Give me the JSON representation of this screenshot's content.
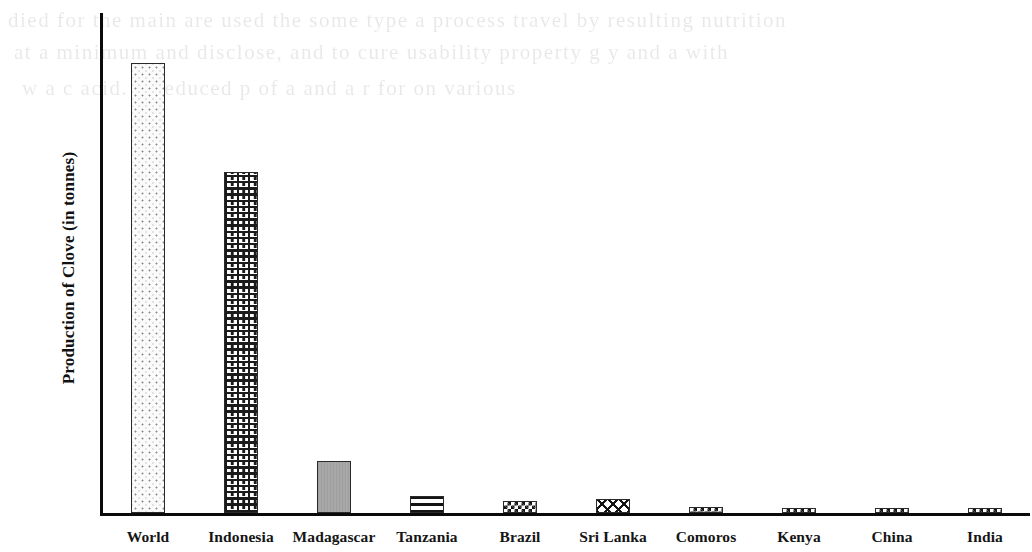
{
  "figure": {
    "kind": "scanned-bar-chart",
    "background_color": "#ffffff",
    "ink_color": "#111111"
  },
  "axes": {
    "y_title": "Production of Clove (in tonnes)",
    "y_ticks": [
      "0",
      "20,000",
      "40,000",
      "60,000",
      "80,000",
      "100,000",
      "120,000",
      "140,000",
      "160,000",
      "180,000"
    ],
    "y_min": 0,
    "y_max": 180000,
    "y_tick_step": 20000,
    "x_title": ""
  },
  "scan_bleed": {
    "note": "faint show-through text from the reverse of the scanned page",
    "lines": [
      "died for the main are used the some type a process   travel by   resulting   nutrition",
      "at a minimum and disclose, and to cure usability property   g   y   and   a   with",
      "w a c acid. A reduced   p                 of      a   and a   r   for     on     various"
    ]
  },
  "chart_data": {
    "type": "bar",
    "title": "",
    "xlabel": "",
    "ylabel": "Production of Clove (in tonnes)",
    "ylim": [
      0,
      180000
    ],
    "grid": false,
    "legend": "none",
    "categories": [
      "World",
      "Indonesia",
      "Madagascar",
      "Tanzania",
      "Brazil",
      "Sri Lanka",
      "Comoros",
      "Kenya",
      "China",
      "India"
    ],
    "values": [
      161900,
      122800,
      18700,
      6100,
      4500,
      5200,
      2000,
      1400,
      1000,
      700
    ],
    "bar_patterns": [
      "dots",
      "brick",
      "solid-gray",
      "horizontal-lines",
      "checkerboard",
      "diamond",
      "checkerboard",
      "checkerboard",
      "checkerboard",
      "checkerboard"
    ],
    "bars": [
      {
        "label": "World",
        "value": 161900,
        "pattern": "dots"
      },
      {
        "label": "Indonesia",
        "value": 122800,
        "pattern": "brick"
      },
      {
        "label": "Madagascar",
        "value": 18700,
        "pattern": "solid-gray"
      },
      {
        "label": "Tanzania",
        "value": 6100,
        "pattern": "horizontal-lines"
      },
      {
        "label": "Brazil",
        "value": 4500,
        "pattern": "checkerboard"
      },
      {
        "label": "Sri Lanka",
        "value": 5200,
        "pattern": "diamond"
      },
      {
        "label": "Comoros",
        "value": 2000,
        "pattern": "checkerboard"
      },
      {
        "label": "Kenya",
        "value": 1400,
        "pattern": "checkerboard"
      },
      {
        "label": "China",
        "value": 1000,
        "pattern": "checkerboard"
      },
      {
        "label": "India",
        "value": 700,
        "pattern": "checkerboard"
      }
    ]
  }
}
